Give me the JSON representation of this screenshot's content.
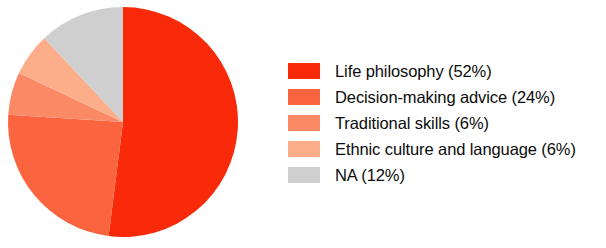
{
  "chart_data": {
    "type": "pie",
    "title": "",
    "subtitle": "",
    "xlabel": "",
    "ylabel": "",
    "grid": false,
    "legend_position": "right",
    "start_angle_deg": 0,
    "direction": "clockwise",
    "categories": [
      "Life philosophy",
      "Decision-making advice",
      "Traditional skills",
      "Ethnic culture and language",
      "NA"
    ],
    "values": [
      52,
      24,
      6,
      6,
      12
    ],
    "value_unit": "%",
    "colors": [
      "#f82a0a",
      "#fa6540",
      "#fa8a65",
      "#fcad8a",
      "#cfcfcf"
    ],
    "slices": [
      {
        "label": "Life philosophy",
        "value": 52,
        "angle_deg": 187.2,
        "color": "#f82a0a"
      },
      {
        "label": "Decision-making advice",
        "value": 24,
        "angle_deg": 86.4,
        "color": "#fa6540"
      },
      {
        "label": "Traditional skills",
        "value": 6,
        "angle_deg": 21.6,
        "color": "#fa8a65"
      },
      {
        "label": "Ethnic culture and language",
        "value": 6,
        "angle_deg": 21.6,
        "color": "#fcad8a"
      },
      {
        "label": "NA",
        "value": 12,
        "angle_deg": 43.2,
        "color": "#cfcfcf"
      }
    ]
  },
  "legend": {
    "items": [
      {
        "label": "Life philosophy (52%)",
        "color": "#f82a0a"
      },
      {
        "label": "Decision-making advice (24%)",
        "color": "#fa6540"
      },
      {
        "label": "Traditional skills (6%)",
        "color": "#fa8a65"
      },
      {
        "label": "Ethnic culture and language (6%)",
        "color": "#fcad8a"
      },
      {
        "label": "NA (12%)",
        "color": "#cfcfcf"
      }
    ]
  },
  "pie_geometry": {
    "center_x": 123,
    "center_y": 122,
    "radius": 115
  }
}
